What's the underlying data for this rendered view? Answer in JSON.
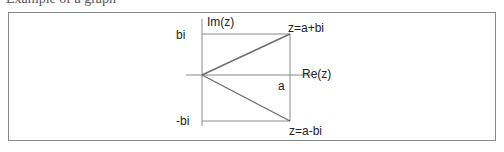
{
  "caption": {
    "text": "Example of a graph"
  },
  "diagram": {
    "axes": {
      "imaginary_label": "Im(z)",
      "real_label": "Re(z)"
    },
    "labels": {
      "bi": "bi",
      "neg_bi": "-bi",
      "a": "a",
      "z_top": "z=a+bi",
      "z_bottom": "z=a-bi"
    },
    "colors": {
      "line": "#8c8c8c",
      "vector": "#6e6e6e",
      "frame": "#8a8a8a",
      "text": "#222222"
    }
  }
}
